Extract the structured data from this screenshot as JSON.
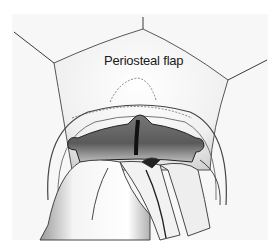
{
  "figure": {
    "kind": "surgical illustration",
    "labels": {
      "flap": "Periosteal flap"
    },
    "colors": {
      "background": "#ffffff",
      "paper": "#f6f6f6",
      "line": "#3a3a3a",
      "shadow": "#222222"
    }
  }
}
